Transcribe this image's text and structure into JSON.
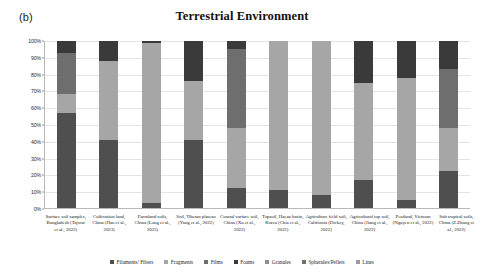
{
  "panel_label": "(b)",
  "chart_data": {
    "type": "bar",
    "subtype": "stacked-percentage",
    "title": "Terrestrial Environment",
    "xlabel": "",
    "ylabel": "",
    "ylim": [
      0,
      100
    ],
    "yunit": "%",
    "grid": true,
    "legend_position": "bottom",
    "ytick_labels": [
      "100%",
      "90%",
      "80%",
      "70%",
      "60%",
      "50%",
      "40%",
      "30%",
      "20%",
      "10%",
      "0%"
    ],
    "ytick_values": [
      100,
      90,
      80,
      70,
      60,
      50,
      40,
      30,
      20,
      10,
      0
    ],
    "categories": [
      "Surface soil samples, Bangladesh (Tajwar et al., 2022)",
      "Cultivation land, China (Hao et al., 2023)",
      "Farmland soils, China (Long et al., 2023)",
      "Soil, Tibetan plateau (Yang et al., 2022)",
      "Coastal surface soil, China (Xu et al., 2022)",
      "Topsoil, Haean basin, Korea (Chia et al., 2022)",
      "Agriculture field soil, California (Dickey, 2022)",
      "Agricultural top soil, China (Jiang et al., 2022)",
      "Peatland, Vietnam (Nguyen et al., 2022)",
      "Sub tropical soils, China (Z.Zhang et al., 2022)"
    ],
    "series": [
      {
        "name": "Filaments/ Fibers",
        "color": "#4f4f4f",
        "values": [
          57,
          41,
          3,
          41,
          12,
          11,
          8,
          17,
          5,
          22
        ]
      },
      {
        "name": "Fragments",
        "color": "#a6a6a6",
        "values": [
          11,
          47,
          96,
          35,
          36,
          89,
          92,
          58,
          73,
          26
        ]
      },
      {
        "name": "Films",
        "color": "#6e6e6e",
        "values": [
          25,
          0,
          0,
          0,
          47,
          0,
          0,
          0,
          0,
          35
        ]
      },
      {
        "name": "Foams",
        "color": "#3a3a3a",
        "values": [
          7,
          12,
          1,
          24,
          5,
          0,
          0,
          25,
          22,
          17
        ]
      },
      {
        "name": "Granules",
        "color": "#8f8f8f",
        "values": [
          0,
          0,
          0,
          0,
          0,
          0,
          0,
          0,
          0,
          0
        ]
      },
      {
        "name": "Spherules/Pellets",
        "color": "#707070",
        "values": [
          0,
          0,
          0,
          0,
          0,
          0,
          0,
          0,
          0,
          0
        ]
      },
      {
        "name": "Lines",
        "color": "#9b9b9b",
        "values": [
          0,
          0,
          0,
          0,
          0,
          0,
          0,
          0,
          0,
          0
        ]
      }
    ]
  }
}
